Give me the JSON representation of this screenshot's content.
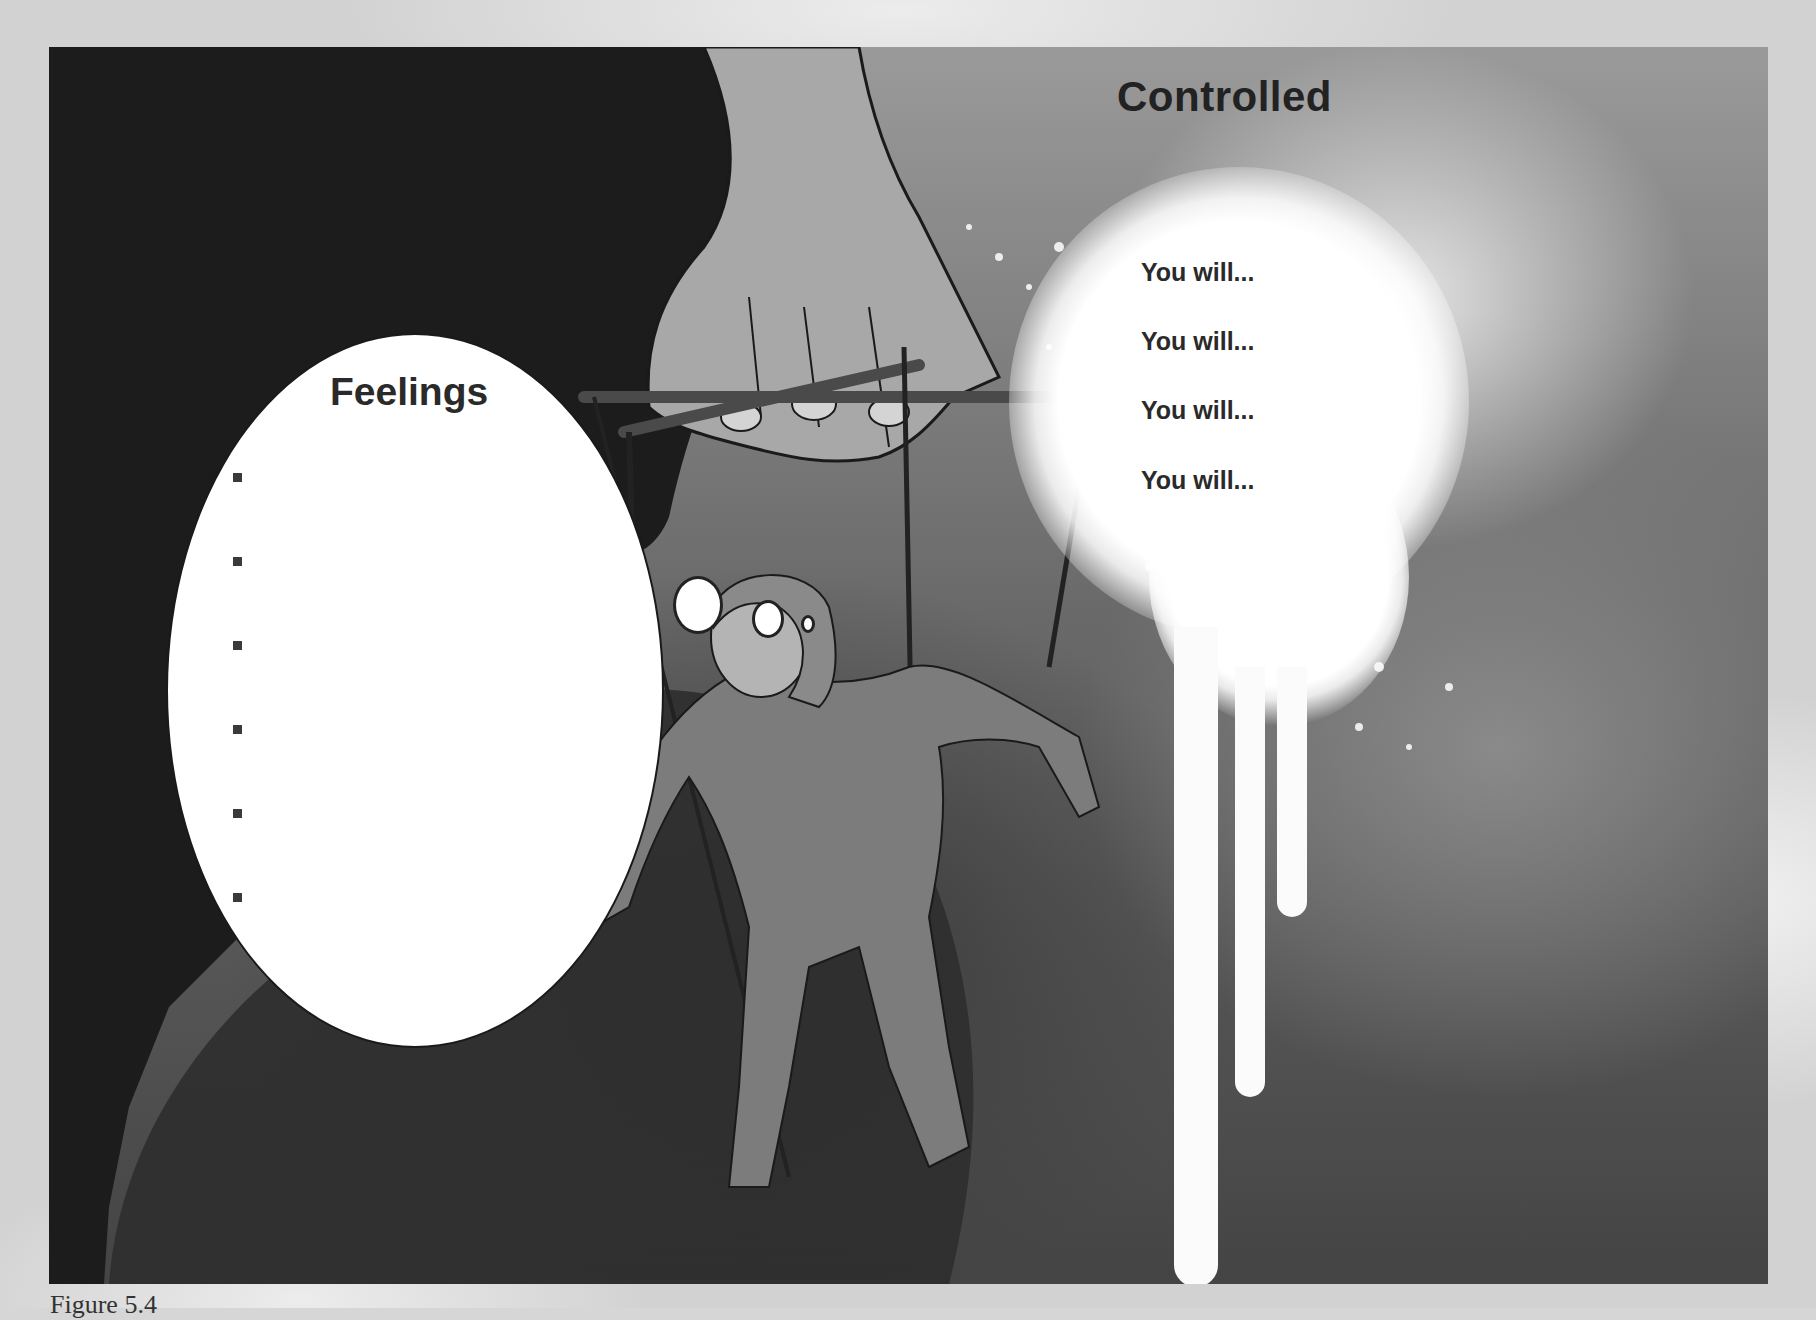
{
  "figure": {
    "caption": "Figure 5.4"
  },
  "feelings_bubble": {
    "title": "Feelings",
    "bullets": [
      "",
      "",
      "",
      "",
      "",
      ""
    ],
    "bullet_count": 6
  },
  "controlled_panel": {
    "title": "Controlled",
    "lines": [
      "You will...",
      "You will...",
      "You will...",
      "You will..."
    ]
  },
  "colors": {
    "page_background": "#d2d2d2",
    "dark_area": "#1a1a1a",
    "bubble_fill": "#ffffff",
    "text": "#222222",
    "splatter": "#ffffff"
  }
}
